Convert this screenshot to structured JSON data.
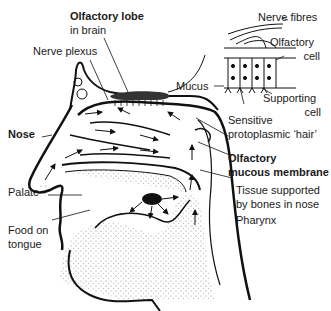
{
  "diagram": {
    "labels": {
      "olfactory_lobe_line1": "Olfactory lobe",
      "olfactory_lobe_line2": "in brain",
      "nerve_plexus": "Nerve plexus",
      "nose": "Nose",
      "palate": "Palate",
      "food_line1": "Food on",
      "food_line2": "tongue",
      "nerve_fibres": "Nerve fibres",
      "olfactory_cell_line1": "Olfactory",
      "olfactory_cell_line2": "cell",
      "mucus": "Mucus",
      "supporting_cell_line1": "Supporting",
      "supporting_cell_line2": "cell",
      "hair_line1": "Sensitive",
      "hair_line2": "protoplasmic ‘hair’",
      "mucous_membrane_line1": "Olfactory",
      "mucous_membrane_line2": "mucous membrane",
      "tissue_line1": "Tissue supported",
      "tissue_line2": "by bones in nose",
      "pharynx": "Pharynx"
    },
    "colors": {
      "line": "#111111",
      "lobe": "#333333",
      "stipple": "#9a9a9a"
    }
  }
}
